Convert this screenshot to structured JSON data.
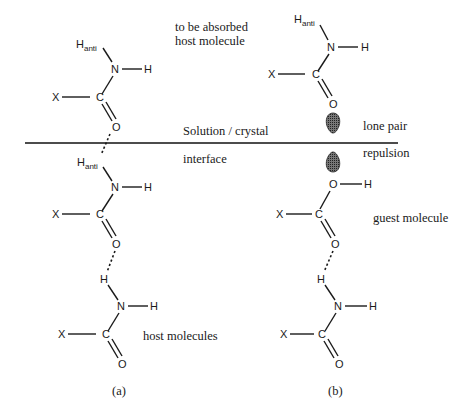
{
  "labels": {
    "absorbed_line1": "to be absorbed",
    "absorbed_line2": "host molecule",
    "solution_crystal": "Solution / crystal",
    "interface": "interface",
    "lone_pair": "lone pair",
    "repulsion": "repulsion",
    "guest_molecule": "guest molecule",
    "host_molecules": "host molecules",
    "panel_a": "(a)",
    "panel_b": "(b)"
  },
  "atoms": {
    "H": "H",
    "anti": "anti",
    "N": "N",
    "C": "C",
    "O": "O",
    "X": "X"
  },
  "colors": {
    "ink": "#1a1a1a",
    "lone_pair_fill": "#555555"
  }
}
